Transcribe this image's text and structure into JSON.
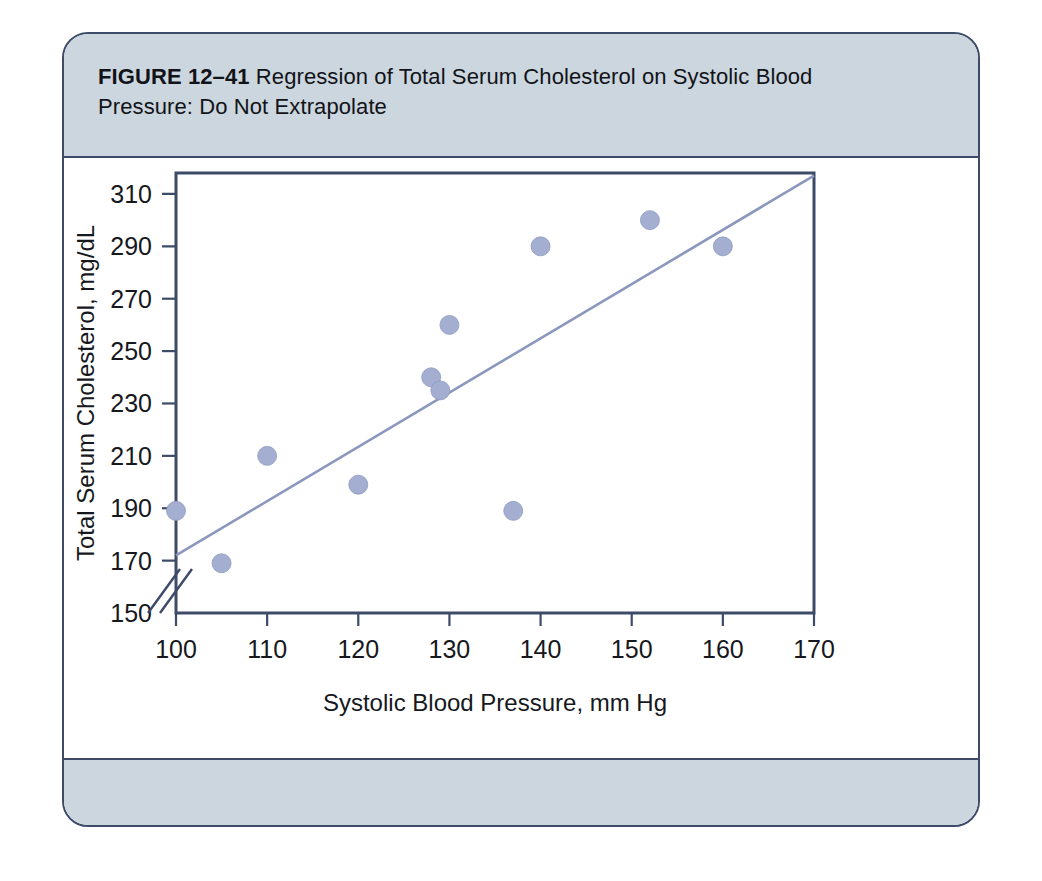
{
  "figure": {
    "label": "FIGURE 12–41",
    "caption": "Regression of Total Serum Cholesterol on Systolic Blood Pressure: Do Not Extrapolate"
  },
  "colors": {
    "band_background": "#ccd6de",
    "frame_border": "#3d4a68",
    "point_fill": "#a3aed0",
    "line_stroke": "#8b97bd",
    "page_background": "#ffffff"
  },
  "chart_data": {
    "type": "scatter",
    "title": "Regression of Total Serum Cholesterol on Systolic Blood Pressure: Do Not Extrapolate",
    "xlabel": "Systolic Blood Pressure, mm Hg",
    "ylabel": "Total Serum Cholesterol, mg/dL",
    "xlim": [
      100,
      170
    ],
    "ylim": [
      150,
      318
    ],
    "xticks": [
      100,
      110,
      120,
      130,
      140,
      150,
      160,
      170
    ],
    "yticks": [
      150,
      170,
      190,
      210,
      230,
      250,
      270,
      290,
      310
    ],
    "xtick_labels": [
      "100",
      "110",
      "120",
      "130",
      "140",
      "150",
      "160",
      "170"
    ],
    "ytick_labels": [
      "150",
      "170",
      "190",
      "210",
      "230",
      "250",
      "270",
      "290",
      "310"
    ],
    "axis_break": {
      "axis": "y",
      "between": [
        150,
        170
      ],
      "style": "double-slash"
    },
    "grid": false,
    "legend": null,
    "series": [
      {
        "name": "Observations",
        "type": "scatter",
        "marker": "filled-circle",
        "points": [
          {
            "x": 100,
            "y": 189
          },
          {
            "x": 105,
            "y": 169
          },
          {
            "x": 110,
            "y": 210
          },
          {
            "x": 120,
            "y": 199
          },
          {
            "x": 128,
            "y": 240
          },
          {
            "x": 129,
            "y": 235
          },
          {
            "x": 130,
            "y": 260
          },
          {
            "x": 137,
            "y": 189
          },
          {
            "x": 140,
            "y": 290
          },
          {
            "x": 152,
            "y": 300
          },
          {
            "x": 160,
            "y": 290
          }
        ]
      },
      {
        "name": "Regression line",
        "type": "line",
        "endpoints": [
          {
            "x": 100,
            "y": 172
          },
          {
            "x": 170,
            "y": 317
          }
        ]
      }
    ]
  }
}
